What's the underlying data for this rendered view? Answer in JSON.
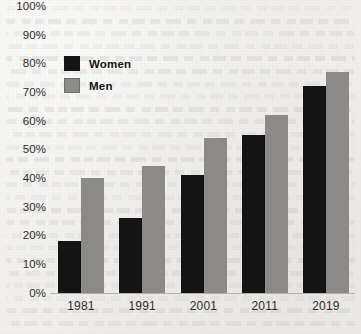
{
  "chart_data": {
    "type": "bar",
    "title": "",
    "xlabel": "",
    "ylabel": "",
    "categories": [
      "1981",
      "1991",
      "2001",
      "2011",
      "2019"
    ],
    "series": [
      {
        "name": "Women",
        "color": "#141414",
        "values": [
          18,
          26,
          41,
          55,
          72
        ]
      },
      {
        "name": "Men",
        "color": "#8b8a88",
        "values": [
          40,
          44,
          54,
          62,
          77
        ]
      }
    ],
    "ylim": [
      0,
      100
    ],
    "ytick_step": 10,
    "ytick_labels": [
      "100%",
      "90%",
      "80%",
      "70%",
      "60%",
      "50%",
      "40%",
      "30%",
      "20%",
      "10%",
      "0%"
    ],
    "ytick_values": [
      100,
      90,
      80,
      70,
      60,
      50,
      40,
      30,
      20,
      10,
      0
    ],
    "grid": false,
    "legend_position": "top-left-inside",
    "value_suffix": "%"
  },
  "legend": {
    "entries": [
      {
        "label": "Women",
        "color": "#141414"
      },
      {
        "label": "Men",
        "color": "#8b8a88"
      }
    ]
  },
  "colors": {
    "women_bar": "#141414",
    "men_bar": "#8b8a88",
    "axis_line": "#b4b1ac",
    "text": "#2f2d2c",
    "paper": "#f1f0ee"
  }
}
